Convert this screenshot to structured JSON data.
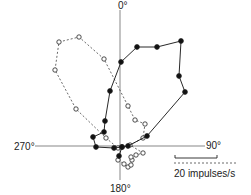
{
  "chart_data": {
    "type": "scatter",
    "subtype": "polar",
    "title": "",
    "angle_labels": {
      "top": "0°",
      "right": "90°",
      "bottom": "180°",
      "left": "270°"
    },
    "scale_bar": {
      "label": "20 impulses/s"
    },
    "center_px": [
      120,
      146
    ],
    "series": [
      {
        "name": "filled",
        "marker": "filled-circle",
        "line": "solid",
        "points_px": [
          [
            119,
            156
          ],
          [
            122,
            147
          ],
          [
            128,
            146
          ],
          [
            147,
            136
          ],
          [
            185,
            92
          ],
          [
            179,
            76
          ],
          [
            181,
            41
          ],
          [
            157,
            47
          ],
          [
            137,
            47
          ],
          [
            121,
            62
          ],
          [
            110,
            91
          ],
          [
            105,
            121
          ],
          [
            104,
            132
          ],
          [
            93,
            137
          ],
          [
            96,
            147
          ],
          [
            114,
            148
          ],
          [
            122,
            147
          ]
        ]
      },
      {
        "name": "open",
        "marker": "open-circle",
        "line": "dashed",
        "points_px": [
          [
            118,
            160
          ],
          [
            124,
            164
          ],
          [
            128,
            167
          ],
          [
            131,
            165
          ],
          [
            132,
            160
          ],
          [
            131,
            157
          ],
          [
            136,
            155
          ],
          [
            143,
            153
          ],
          [
            130,
            145
          ],
          [
            143,
            138
          ],
          [
            145,
            124
          ],
          [
            135,
            120
          ],
          [
            128,
            106
          ],
          [
            104,
            59
          ],
          [
            79,
            37
          ],
          [
            59,
            42
          ],
          [
            55,
            70
          ],
          [
            76,
            109
          ],
          [
            106,
            138
          ],
          [
            118,
            148
          ]
        ]
      }
    ]
  }
}
